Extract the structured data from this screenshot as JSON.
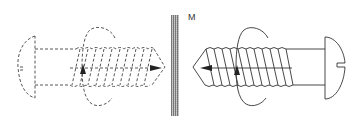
{
  "diagram": {
    "mirror_label": "M",
    "colors": {
      "line": "#333333",
      "dashed_line": "#444444",
      "mirror_dark": "#555555",
      "mirror_light": "#dddddd",
      "background": "#ffffff"
    },
    "objects": [
      {
        "name": "mirror-image-screw",
        "style": "dashed",
        "side": "left",
        "axis_arrow_direction": "right"
      },
      {
        "name": "real-screw",
        "style": "solid",
        "side": "right",
        "axis_arrow_direction": "left"
      }
    ]
  }
}
